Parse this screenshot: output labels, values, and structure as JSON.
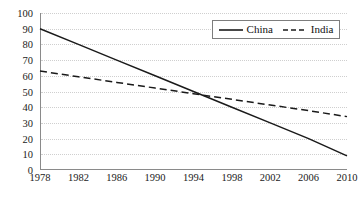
{
  "chart_data": {
    "type": "line",
    "title": "",
    "xlabel": "",
    "ylabel": "",
    "x": [
      1978,
      1982,
      1986,
      1990,
      1994,
      1998,
      2002,
      2006,
      2010
    ],
    "xlim": [
      1978,
      2010
    ],
    "ylim": [
      0,
      100
    ],
    "yticks": [
      0,
      10,
      20,
      30,
      40,
      50,
      60,
      70,
      80,
      90,
      100
    ],
    "xticks": [
      "1978",
      "1982",
      "1986",
      "1990",
      "1994",
      "1998",
      "2002",
      "2006",
      "2010"
    ],
    "grid": "horizontal-dotted",
    "legend_position": "top-right",
    "series": [
      {
        "name": "China",
        "style": "solid",
        "color": "#1a1a1a",
        "values": [
          90,
          80,
          70,
          60,
          50,
          40,
          30,
          20,
          9
        ]
      },
      {
        "name": "India",
        "style": "dashed",
        "color": "#1a1a1a",
        "values": [
          63,
          59.4,
          55.8,
          52.2,
          48.6,
          45,
          41.4,
          37.8,
          34
        ]
      }
    ],
    "annotations": []
  },
  "legend": {
    "entries": [
      {
        "label": "China",
        "swatch": "solid-line-icon"
      },
      {
        "label": "India",
        "swatch": "dashed-line-icon"
      }
    ]
  },
  "axes": {
    "y_labels": [
      "100",
      "90",
      "80",
      "70",
      "60",
      "50",
      "40",
      "30",
      "20",
      "10",
      "0"
    ],
    "x_labels": [
      "1978",
      "1982",
      "1986",
      "1990",
      "1994",
      "1998",
      "2002",
      "2006",
      "2010"
    ]
  }
}
